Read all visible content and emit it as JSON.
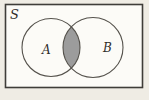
{
  "figure": {
    "type": "venn-diagram",
    "labels": {
      "universal_set": "S",
      "set_a": "A",
      "set_b": "B"
    },
    "colors": {
      "intersection_fill": "#9c9c9c",
      "box_fill": "#fcfbf7",
      "circle_outline": "#55524c",
      "box_border": "#3f3d39",
      "page_background": "#efece4",
      "label_text": "#2f2d2a"
    }
  }
}
